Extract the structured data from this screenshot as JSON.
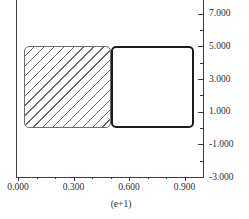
{
  "chart_data": {
    "type": "bar",
    "title": "",
    "xlabel": "(e+1)",
    "ylabel": "",
    "grid": "off",
    "legend": "none",
    "y_axis_side": "right",
    "xlim": [
      0.0,
      1.0
    ],
    "ylim": [
      -3.0,
      7.83
    ],
    "x_major_ticks": {
      "values": [
        0.0,
        0.3,
        0.6,
        0.9
      ],
      "labels": [
        "0.000",
        "0.300",
        "0.600",
        "0.900"
      ]
    },
    "x_minor_ticks": [
      0.1,
      0.2,
      0.4,
      0.5,
      0.7,
      0.8
    ],
    "y_major_ticks": {
      "values": [
        7,
        5,
        3,
        1,
        -1,
        -3
      ],
      "labels": [
        "7.000",
        "5.000",
        "3.000",
        "1.000",
        "-1.000",
        "-3.000"
      ]
    },
    "y_minor_ticks": [
      6,
      4,
      2,
      0,
      -2
    ],
    "bars": [
      {
        "name": "hatched-bar",
        "x_start": 0.03,
        "x_end": 0.5,
        "y_base": 0.0,
        "y_top": 5.0,
        "fill": "diagonal-hatch",
        "border_color": "#6e6e6e"
      },
      {
        "name": "outlined-bar",
        "x_start": 0.5,
        "x_end": 0.95,
        "y_base": 0.0,
        "y_top": 5.0,
        "fill": "white",
        "border_color": "#1c1c1c"
      }
    ],
    "colors": {
      "axis": "#3c3c3c",
      "tick_label": "#2e2e2e",
      "hatch_line": "#6a6a6a",
      "background": "#ffffff"
    }
  }
}
